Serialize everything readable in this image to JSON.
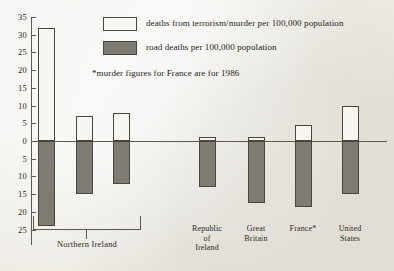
{
  "chart_data": {
    "type": "bar",
    "title": "",
    "subtitle": "",
    "xlabel": "",
    "ylabel": "",
    "orientation": "vertical",
    "grid": false,
    "legend_position": "top-right",
    "note": "*murder figures for France are for 1986",
    "ylim": [
      -27,
      35
    ],
    "y_ticks_above_zero": [
      "35",
      "30",
      "25",
      "20",
      "15",
      "10",
      "5",
      "0"
    ],
    "y_ticks_below_zero": [
      "5",
      "10",
      "15",
      "20",
      "25"
    ],
    "axis_tick_values": [
      35,
      30,
      25,
      20,
      15,
      10,
      5,
      0,
      -5,
      -10,
      -15,
      -20,
      -25
    ],
    "categories": [
      "Northern Ireland 1",
      "Northern Ireland 2",
      "Northern Ireland 3",
      "Republic of Ireland",
      "Great Britain",
      "France*",
      "United States"
    ],
    "series": [
      {
        "name": "deaths from terrorism/murder per 100,000 population",
        "color": "#f7f5f0",
        "direction": "up",
        "values": [
          32,
          7,
          8,
          1,
          1.2,
          4.5,
          10
        ]
      },
      {
        "name": "road deaths per 100,000 population",
        "color": "#7e7a74",
        "direction": "down",
        "values": [
          -24,
          -15,
          -12,
          -13,
          -17.5,
          -18.5,
          -15
        ]
      }
    ],
    "group_bracket_label": "Northern Ireland"
  },
  "legend": {
    "entries": [
      {
        "swatch": "white",
        "label": "deaths from terrorism/murder per 100,000 population"
      },
      {
        "swatch": "grey",
        "label": "road deaths per 100,000 population"
      }
    ]
  },
  "axis": {
    "labels_top": [
      {
        "text": "35",
        "value": 35
      },
      {
        "text": "30",
        "value": 30
      },
      {
        "text": "25",
        "value": 25
      },
      {
        "text": "20",
        "value": 20
      },
      {
        "text": "15",
        "value": 15
      },
      {
        "text": "10",
        "value": 10
      },
      {
        "text": "5",
        "value": 5
      },
      {
        "text": "0",
        "value": 0
      }
    ],
    "labels_bottom": [
      {
        "text": "5",
        "value": -5
      },
      {
        "text": "10",
        "value": -10
      },
      {
        "text": "15",
        "value": -15
      },
      {
        "text": "20",
        "value": -20
      },
      {
        "text": "25",
        "value": -25
      }
    ]
  },
  "categories_display": [
    {
      "line1": "Republic",
      "line2": "of",
      "line3": "Ireland"
    },
    {
      "line1": "Great",
      "line2": "Britain",
      "line3": ""
    },
    {
      "line1": "France*",
      "line2": "",
      "line3": ""
    },
    {
      "line1": "United",
      "line2": "States",
      "line3": ""
    }
  ],
  "group_label": "Northern Ireland",
  "note_text": "*murder figures for France are for 1986"
}
